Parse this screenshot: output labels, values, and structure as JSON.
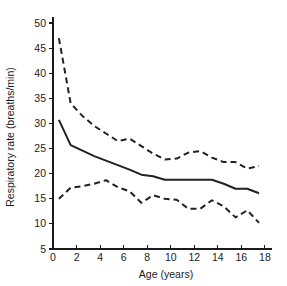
{
  "chart_data": {
    "type": "line",
    "title": "",
    "xlabel": "Age (years)",
    "ylabel": "Respiratory rate (breaths/min)",
    "xlim": [
      0,
      18.6
    ],
    "ylim": [
      5,
      51
    ],
    "xticks": [
      0,
      2,
      4,
      6,
      8,
      10,
      12,
      14,
      16,
      18
    ],
    "yticks": [
      5,
      10,
      15,
      20,
      25,
      30,
      35,
      40,
      45,
      50
    ],
    "xtick_labels": [
      "0",
      "2",
      "4",
      "6",
      "8",
      "10",
      "12",
      "14",
      "16",
      "18"
    ],
    "ytick_labels": [
      "5",
      "10",
      "15",
      "20",
      "25",
      "30",
      "35",
      "40",
      "45",
      "50"
    ],
    "grid": false,
    "legend": "none",
    "line_color": "#222222",
    "x": [
      0.5,
      1.5,
      2.5,
      3.5,
      4.5,
      5.5,
      6.5,
      7.5,
      8.5,
      9.5,
      10.5,
      11.5,
      12.5,
      13.5,
      14.5,
      15.5,
      16.5,
      17.5
    ],
    "series": [
      {
        "name": "Upper centile",
        "style": "dashed",
        "values": [
          47.0,
          34.0,
          31.5,
          29.5,
          28.0,
          26.5,
          27.0,
          25.5,
          24.0,
          22.8,
          23.0,
          24.2,
          24.5,
          23.2,
          22.3,
          22.3,
          21.0,
          21.5
        ]
      },
      {
        "name": "Median",
        "style": "solid",
        "values": [
          30.7,
          25.7,
          24.6,
          23.5,
          22.6,
          21.7,
          20.8,
          19.8,
          19.5,
          18.8,
          18.8,
          18.8,
          18.8,
          18.8,
          18.0,
          17.0,
          17.0,
          16.1
        ]
      },
      {
        "name": "Lower centile",
        "style": "dashed",
        "values": [
          15.0,
          17.2,
          17.5,
          18.0,
          18.7,
          17.3,
          16.5,
          14.2,
          15.7,
          15.0,
          14.8,
          13.0,
          13.0,
          14.7,
          13.5,
          11.3,
          12.7,
          10.2
        ]
      }
    ]
  }
}
